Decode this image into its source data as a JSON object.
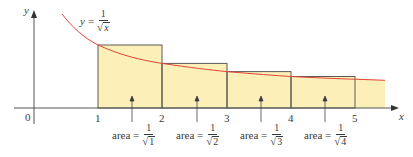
{
  "function_label": {
    "lhs": "y",
    "eq": "=",
    "num": "1",
    "rad": "√",
    "den_var": "x"
  },
  "axes": {
    "x_label": "x",
    "y_label": "y",
    "origin": "0"
  },
  "x_ticks": [
    "1",
    "2",
    "3",
    "4",
    "5"
  ],
  "area_labels": [
    {
      "text": "area =",
      "num": "1",
      "rad": "√",
      "den": "1"
    },
    {
      "text": "area =",
      "num": "1",
      "rad": "√",
      "den": "2"
    },
    {
      "text": "area =",
      "num": "1",
      "rad": "√",
      "den": "3"
    },
    {
      "text": "area =",
      "num": "1",
      "rad": "√",
      "den": "4"
    }
  ],
  "colors": {
    "curve": "#e0443a",
    "fill": "#fcefb8",
    "rect_stroke": "#555555",
    "axis": "#555555",
    "text": "#3a3a3a"
  },
  "geometry": {
    "origin_px": [
      34,
      108
    ],
    "x_unit_px": 64.3,
    "y_unit_px": 63,
    "rectangles": [
      {
        "x_from": 1,
        "x_to": 2,
        "height": 1.0
      },
      {
        "x_from": 2,
        "x_to": 3,
        "height": 0.7071
      },
      {
        "x_from": 3,
        "x_to": 4,
        "height": 0.5774
      },
      {
        "x_from": 4,
        "x_to": 5,
        "height": 0.5
      }
    ]
  }
}
